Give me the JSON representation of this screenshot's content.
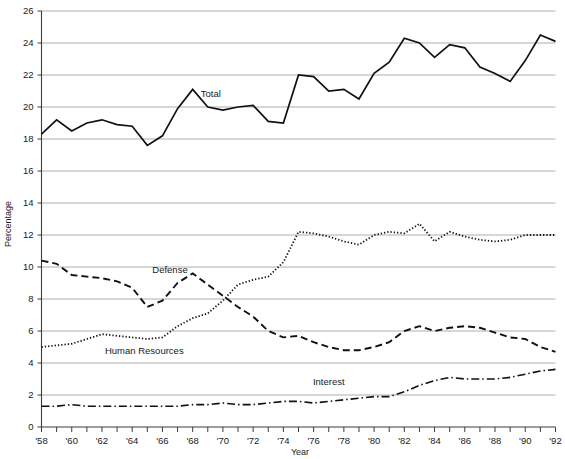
{
  "chart_data": {
    "type": "line",
    "title": "",
    "xlabel": "Year",
    "ylabel": "Percentage",
    "ylim": [
      0,
      26
    ],
    "xlim": [
      1958,
      1992
    ],
    "grid": true,
    "legend": "inline-labels",
    "y_ticks": [
      0,
      2,
      4,
      6,
      8,
      10,
      12,
      14,
      16,
      18,
      20,
      22,
      24,
      26
    ],
    "x_ticks": [
      1958,
      1959,
      1960,
      1961,
      1962,
      1963,
      1964,
      1965,
      1966,
      1967,
      1968,
      1969,
      1970,
      1971,
      1972,
      1973,
      1974,
      1975,
      1976,
      1977,
      1978,
      1979,
      1980,
      1981,
      1982,
      1983,
      1984,
      1985,
      1986,
      1987,
      1988,
      1989,
      1990,
      1991,
      1992
    ],
    "x_tick_labels": [
      "'58",
      "",
      "'60",
      "",
      "'62",
      "",
      "'64",
      "",
      "'66",
      "",
      "'68",
      "",
      "'70",
      "",
      "'72",
      "",
      "'74",
      "",
      "'76",
      "",
      "'78",
      "",
      "'80",
      "",
      "'82",
      "",
      "'84",
      "",
      "'86",
      "",
      "'88",
      "",
      "'90",
      "",
      "'92"
    ],
    "y_tick_labels": [
      "0",
      "2",
      "4",
      "6",
      "8",
      "10",
      "12",
      "14",
      "16",
      "18",
      "20",
      "22",
      "24",
      "26"
    ],
    "x": [
      1958,
      1959,
      1960,
      1961,
      1962,
      1963,
      1964,
      1965,
      1966,
      1967,
      1968,
      1969,
      1970,
      1971,
      1972,
      1973,
      1974,
      1975,
      1976,
      1977,
      1978,
      1979,
      1980,
      1981,
      1982,
      1983,
      1984,
      1985,
      1986,
      1987,
      1988,
      1989,
      1990,
      1991,
      1992
    ],
    "series": [
      {
        "name": "Total",
        "label": "Total",
        "style": "solid",
        "color": "#111111",
        "width": 1.7,
        "label_x": 1969.2,
        "label_y": 20.6,
        "values": [
          18.3,
          19.2,
          18.5,
          19.0,
          19.2,
          18.9,
          18.8,
          17.6,
          18.2,
          19.9,
          21.1,
          20.0,
          19.8,
          20.0,
          20.1,
          19.1,
          19.0,
          22.0,
          21.9,
          21.0,
          21.1,
          20.5,
          22.1,
          22.8,
          24.3,
          24.0,
          23.1,
          23.9,
          23.7,
          22.5,
          22.1,
          21.6,
          22.9,
          24.5,
          24.1
        ]
      },
      {
        "name": "Defense",
        "label": "Defense",
        "style": "dashed",
        "color": "#111111",
        "width": 1.9,
        "dash": "7,4",
        "label_x": 1966.5,
        "label_y": 9.65,
        "values": [
          10.4,
          10.2,
          9.5,
          9.4,
          9.3,
          9.1,
          8.7,
          7.5,
          7.9,
          9.0,
          9.6,
          8.9,
          8.2,
          7.5,
          6.9,
          6.0,
          5.6,
          5.7,
          5.3,
          5.0,
          4.8,
          4.8,
          5.0,
          5.3,
          6.0,
          6.3,
          6.0,
          6.2,
          6.3,
          6.2,
          5.9,
          5.6,
          5.5,
          5.0,
          4.7
        ]
      },
      {
        "name": "Human Resources",
        "label": "Human Resources",
        "style": "dotted",
        "color": "#111111",
        "width": 1.8,
        "dash": "1.3,2.0",
        "label_x": 1964.8,
        "label_y": 4.55,
        "values": [
          5.0,
          5.1,
          5.2,
          5.5,
          5.8,
          5.7,
          5.6,
          5.5,
          5.6,
          6.3,
          6.8,
          7.1,
          7.9,
          8.9,
          9.2,
          9.4,
          10.3,
          12.2,
          12.1,
          11.9,
          11.6,
          11.4,
          12.0,
          12.2,
          12.1,
          12.7,
          11.6,
          12.2,
          11.9,
          11.7,
          11.6,
          11.7,
          12.0,
          12.0,
          12.0
        ]
      },
      {
        "name": "Interest",
        "label": "Interest",
        "style": "dash-dot",
        "color": "#111111",
        "width": 1.6,
        "dash": "8,3,1.5,3",
        "label_x": 1977.0,
        "label_y": 2.62,
        "values": [
          1.3,
          1.3,
          1.4,
          1.3,
          1.3,
          1.3,
          1.3,
          1.3,
          1.3,
          1.3,
          1.4,
          1.4,
          1.5,
          1.4,
          1.4,
          1.5,
          1.6,
          1.6,
          1.5,
          1.6,
          1.7,
          1.8,
          1.9,
          1.9,
          2.2,
          2.6,
          2.9,
          3.1,
          3.0,
          3.0,
          3.0,
          3.1,
          3.3,
          3.5,
          3.6
        ]
      }
    ]
  },
  "labels": {
    "y_axis_title": "Percentage",
    "x_axis_title": "Year",
    "series_total": "Total",
    "series_defense": "Defense",
    "series_human_resources": "Human Resources",
    "series_interest": "Interest"
  }
}
